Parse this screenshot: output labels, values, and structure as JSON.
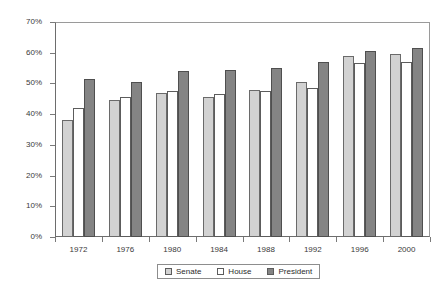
{
  "chart_data": {
    "type": "bar",
    "title": "",
    "subtitle": "",
    "xlabel": "",
    "ylabel": "",
    "categories": [
      "1972",
      "1976",
      "1980",
      "1984",
      "1988",
      "1992",
      "1996",
      "2000"
    ],
    "series": [
      {
        "name": "Senate",
        "color": "#d2d2d2",
        "values": [
          38.0,
          44.5,
          47.0,
          45.5,
          48.0,
          50.5,
          59.0,
          59.5
        ]
      },
      {
        "name": "House",
        "color": "#ffffff",
        "values": [
          42.0,
          45.5,
          47.5,
          46.5,
          47.5,
          48.5,
          56.5,
          57.0
        ]
      },
      {
        "name": "President",
        "color": "#848484",
        "values": [
          51.5,
          50.5,
          54.0,
          54.5,
          55.0,
          57.0,
          60.5,
          61.5
        ]
      }
    ],
    "ylim": [
      0,
      70
    ],
    "ytick_values": [
      0,
      10,
      20,
      30,
      40,
      50,
      60,
      70
    ],
    "ytick_labels": [
      "0%",
      "10%",
      "20%",
      "30%",
      "40%",
      "50%",
      "60%",
      "70%"
    ],
    "grid": false,
    "legend_position": "bottom-center",
    "legend_entries": [
      "Senate",
      "House",
      "President"
    ]
  },
  "legend": {
    "items": [
      {
        "label": "Senate",
        "swatch": "senate"
      },
      {
        "label": "House",
        "swatch": "house"
      },
      {
        "label": "President",
        "swatch": "president"
      }
    ]
  }
}
